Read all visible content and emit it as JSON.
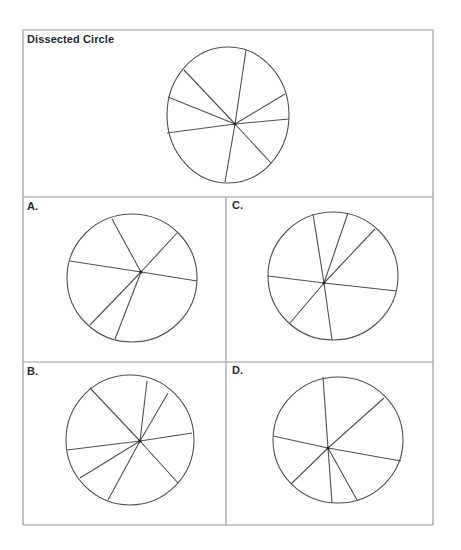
{
  "title": "Dissected Circle",
  "colors": {
    "background": "#ffffff",
    "frame": "#9a9a9a",
    "stroke": "#505050",
    "text": "#2a2a2a"
  },
  "panels": [
    {
      "id": "target",
      "label": "Dissected Circle",
      "label_pos": [
        27,
        34
      ],
      "circle": {
        "cx": 228,
        "cy": 115,
        "rx": 61,
        "ry": 68
      },
      "hub": [
        235,
        124
      ],
      "spokes": [
        [
          246,
          50
        ],
        [
          184,
          70
        ],
        [
          168,
          97
        ],
        [
          167,
          133
        ],
        [
          225,
          182
        ],
        [
          271,
          163
        ],
        [
          289,
          119
        ],
        [
          285,
          94
        ]
      ]
    },
    {
      "id": "option-a",
      "label": "A.",
      "label_pos": [
        27,
        201
      ],
      "circle": {
        "cx": 132,
        "cy": 278,
        "rx": 65,
        "ry": 64
      },
      "hub": [
        141,
        272
      ],
      "spokes": [
        [
          112,
          219
        ],
        [
          177,
          233
        ],
        [
          70,
          261
        ],
        [
          197,
          281
        ],
        [
          90,
          325
        ],
        [
          115,
          339
        ]
      ]
    },
    {
      "id": "option-c",
      "label": "C.",
      "label_pos": [
        232,
        200
      ],
      "circle": {
        "cx": 333,
        "cy": 276,
        "rx": 65,
        "ry": 64
      },
      "hub": [
        324,
        283
      ],
      "spokes": [
        [
          313,
          214
        ],
        [
          348,
          213
        ],
        [
          375,
          229
        ],
        [
          268,
          276
        ],
        [
          397,
          291
        ],
        [
          290,
          323
        ],
        [
          332,
          340
        ]
      ]
    },
    {
      "id": "option-b",
      "label": "B.",
      "label_pos": [
        27,
        366
      ],
      "circle": {
        "cx": 130,
        "cy": 440,
        "rx": 64,
        "ry": 65
      },
      "hub": [
        140,
        441
      ],
      "spokes": [
        [
          90,
          388
        ],
        [
          147,
          381
        ],
        [
          168,
          393
        ],
        [
          192,
          433
        ],
        [
          67,
          450
        ],
        [
          80,
          478
        ],
        [
          178,
          483
        ],
        [
          108,
          500
        ]
      ]
    },
    {
      "id": "option-d",
      "label": "D.",
      "label_pos": [
        232,
        365
      ],
      "circle": {
        "cx": 338,
        "cy": 440,
        "rx": 65,
        "ry": 63
      },
      "hub": [
        328,
        448
      ],
      "spokes": [
        [
          323,
          377
        ],
        [
          384,
          398
        ],
        [
          273,
          436
        ],
        [
          401,
          461
        ],
        [
          291,
          484
        ],
        [
          332,
          503
        ],
        [
          357,
          500
        ]
      ]
    }
  ],
  "frame": {
    "outer": {
      "x1": 23,
      "y1": 30,
      "x2": 433,
      "y2": 525
    },
    "h_dividers": [
      197,
      362
    ],
    "v_divider": {
      "x": 226,
      "y1": 197,
      "y2": 525
    }
  }
}
